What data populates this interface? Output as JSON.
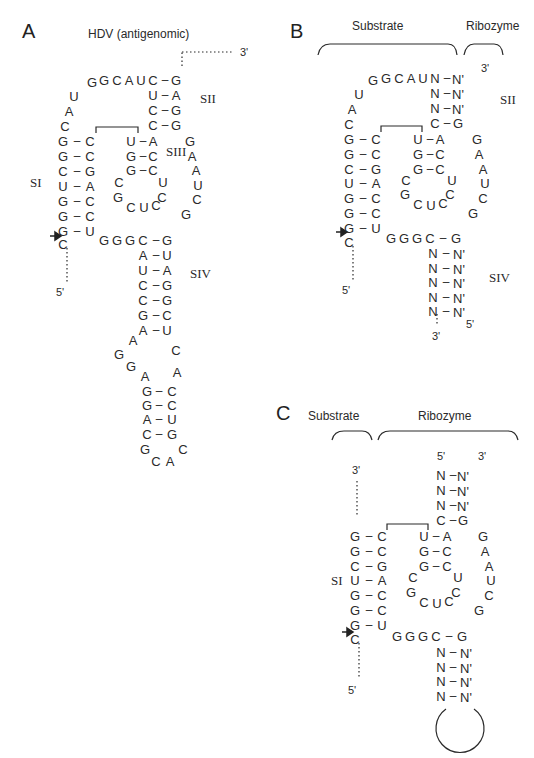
{
  "panels": {
    "A": {
      "letter": "A",
      "title": "HDV (antigenomic)",
      "stems": {
        "SI": "SI",
        "SII": "SII",
        "SIII": "SIII",
        "SIV": "SIV"
      },
      "ends": {
        "three_prime": "3'",
        "five_prime": "5'"
      }
    },
    "B": {
      "letter": "B",
      "brackets": {
        "substrate": "Substrate",
        "ribozyme": "Ribozyme"
      },
      "stems": {
        "SII": "SII",
        "SIV": "SIV"
      },
      "ends": {
        "three_prime_top": "3'",
        "five_prime_left": "5'",
        "five_prime_bottom": "5'",
        "three_prime_bottom": "3'"
      }
    },
    "C": {
      "letter": "C",
      "brackets": {
        "substrate": "Substrate",
        "ribozyme": "Ribozyme"
      },
      "stems": {
        "SI": "SI"
      },
      "ends": {
        "three_prime_substrate": "3'",
        "five_prime_substrate": "5'",
        "five_prime_top": "5'",
        "three_prime_top": "3'"
      }
    }
  },
  "nucleotides": {
    "A": [
      [
        "G",
        92,
        82
      ],
      [
        "G",
        104,
        80
      ],
      [
        "C",
        117,
        80
      ],
      [
        "A",
        129,
        80
      ],
      [
        "U",
        141,
        80
      ],
      [
        "C",
        153,
        80
      ],
      [
        "-",
        165,
        79
      ],
      [
        "G",
        176,
        80
      ],
      [
        "U",
        74,
        96
      ],
      [
        "A",
        69,
        111
      ],
      [
        "C",
        65,
        126
      ],
      [
        "G",
        63,
        141
      ],
      [
        "-",
        77,
        140
      ],
      [
        "C",
        90,
        141
      ],
      [
        "G",
        63,
        156
      ],
      [
        "-",
        77,
        155
      ],
      [
        "C",
        90,
        156
      ],
      [
        "C",
        63,
        171
      ],
      [
        "-",
        77,
        170
      ],
      [
        "G",
        90,
        171
      ],
      [
        "U",
        63,
        186
      ],
      [
        "-",
        77,
        185
      ],
      [
        "A",
        90,
        186
      ],
      [
        "G",
        63,
        201
      ],
      [
        "-",
        77,
        200
      ],
      [
        "C",
        90,
        201
      ],
      [
        "G",
        63,
        216
      ],
      [
        "-",
        77,
        215
      ],
      [
        "C",
        90,
        216
      ],
      [
        "G",
        63,
        231
      ],
      [
        "-",
        77,
        230
      ],
      [
        "U",
        90,
        231
      ],
      [
        "C",
        63,
        244
      ],
      [
        "U",
        153,
        95
      ],
      [
        "-",
        165,
        94
      ],
      [
        "A",
        176,
        95
      ],
      [
        "C",
        153,
        110
      ],
      [
        "-",
        165,
        109
      ],
      [
        "G",
        176,
        110
      ],
      [
        "C",
        153,
        125
      ],
      [
        "-",
        165,
        124
      ],
      [
        "G",
        176,
        125
      ],
      [
        "U",
        131,
        141
      ],
      [
        "-",
        143,
        140
      ],
      [
        "A",
        153,
        141
      ],
      [
        "G",
        131,
        156
      ],
      [
        "-",
        143,
        155
      ],
      [
        "C",
        153,
        156
      ],
      [
        "G",
        131,
        170
      ],
      [
        "-",
        143,
        169
      ],
      [
        "C",
        153,
        170
      ],
      [
        "C",
        119,
        182
      ],
      [
        "U",
        163,
        182
      ],
      [
        "G",
        118,
        197
      ],
      [
        "C",
        162,
        197
      ],
      [
        "C",
        131,
        207
      ],
      [
        "U",
        144,
        207
      ],
      [
        "C",
        156,
        205
      ],
      [
        "G",
        190,
        141
      ],
      [
        "A",
        192,
        156
      ],
      [
        "A",
        196,
        170
      ],
      [
        "U",
        198,
        185
      ],
      [
        "C",
        197,
        199
      ],
      [
        "G",
        186,
        214
      ],
      [
        "G",
        104,
        240
      ],
      [
        "G",
        117,
        240
      ],
      [
        "G",
        130,
        240
      ],
      [
        "C",
        143,
        240
      ],
      [
        "-",
        156,
        239
      ],
      [
        "G",
        167,
        240
      ],
      [
        "A",
        143,
        255
      ],
      [
        "-",
        156,
        254
      ],
      [
        "U",
        167,
        255
      ],
      [
        "U",
        143,
        270
      ],
      [
        "-",
        156,
        269
      ],
      [
        "A",
        167,
        270
      ],
      [
        "C",
        143,
        285
      ],
      [
        "-",
        156,
        284
      ],
      [
        "G",
        167,
        285
      ],
      [
        "C",
        143,
        300
      ],
      [
        "-",
        156,
        299
      ],
      [
        "G",
        167,
        300
      ],
      [
        "G",
        143,
        315
      ],
      [
        "-",
        156,
        314
      ],
      [
        "C",
        167,
        315
      ],
      [
        "A",
        143,
        330
      ],
      [
        "-",
        156,
        329
      ],
      [
        "U",
        167,
        330
      ],
      [
        "A",
        133,
        340
      ],
      [
        "G",
        119,
        354
      ],
      [
        "G",
        131,
        366
      ],
      [
        "A",
        145,
        376
      ],
      [
        "C",
        176,
        350
      ],
      [
        "A",
        177,
        372
      ],
      [
        "G",
        147,
        391
      ],
      [
        "-",
        159,
        390
      ],
      [
        "C",
        172,
        391
      ],
      [
        "G",
        147,
        405
      ],
      [
        "-",
        159,
        404
      ],
      [
        "C",
        172,
        405
      ],
      [
        "A",
        147,
        419
      ],
      [
        "-",
        159,
        418
      ],
      [
        "U",
        172,
        419
      ],
      [
        "C",
        147,
        434
      ],
      [
        "-",
        159,
        433
      ],
      [
        "G",
        172,
        434
      ],
      [
        "G",
        145,
        449
      ],
      [
        "C",
        183,
        449
      ],
      [
        "C",
        156,
        461
      ],
      [
        "A",
        170,
        461
      ]
    ],
    "B": [
      [
        "G",
        373,
        80
      ],
      [
        "G",
        386,
        78
      ],
      [
        "C",
        399,
        78
      ],
      [
        "A",
        411,
        78
      ],
      [
        "U",
        423,
        78
      ],
      [
        "N",
        435,
        78
      ],
      [
        "-",
        447,
        77
      ],
      [
        "N'",
        458,
        79
      ],
      [
        "U",
        359,
        94
      ],
      [
        "A",
        352,
        109
      ],
      [
        "C",
        349,
        124
      ],
      [
        "N",
        435,
        93
      ],
      [
        "-",
        447,
        92
      ],
      [
        "N'",
        458,
        94
      ],
      [
        "N",
        435,
        108
      ],
      [
        "-",
        447,
        107
      ],
      [
        "N'",
        458,
        109
      ],
      [
        "C",
        435,
        123
      ],
      [
        "-",
        447,
        122
      ],
      [
        "G",
        458,
        123
      ],
      [
        "G",
        349,
        139
      ],
      [
        "-",
        363,
        138
      ],
      [
        "C",
        376,
        139
      ],
      [
        "G",
        349,
        154
      ],
      [
        "-",
        363,
        153
      ],
      [
        "C",
        376,
        154
      ],
      [
        "C",
        349,
        169
      ],
      [
        "-",
        363,
        168
      ],
      [
        "G",
        376,
        169
      ],
      [
        "U",
        349,
        183
      ],
      [
        "-",
        363,
        182
      ],
      [
        "A",
        376,
        183
      ],
      [
        "G",
        349,
        198
      ],
      [
        "-",
        363,
        197
      ],
      [
        "C",
        376,
        198
      ],
      [
        "G",
        349,
        213
      ],
      [
        "-",
        363,
        212
      ],
      [
        "C",
        376,
        213
      ],
      [
        "G",
        349,
        228
      ],
      [
        "-",
        363,
        227
      ],
      [
        "U",
        376,
        228
      ],
      [
        "C",
        349,
        242
      ],
      [
        "U",
        418,
        139
      ],
      [
        "-",
        430,
        138
      ],
      [
        "A",
        440,
        139
      ],
      [
        "G",
        418,
        154
      ],
      [
        "-",
        430,
        153
      ],
      [
        "C",
        440,
        154
      ],
      [
        "G",
        418,
        169
      ],
      [
        "-",
        430,
        168
      ],
      [
        "C",
        440,
        169
      ],
      [
        "C",
        406,
        180
      ],
      [
        "U",
        452,
        180
      ],
      [
        "G",
        405,
        194
      ],
      [
        "C",
        450,
        194
      ],
      [
        "C",
        418,
        204
      ],
      [
        "U",
        431,
        205
      ],
      [
        "C",
        443,
        203
      ],
      [
        "G",
        477,
        139
      ],
      [
        "A",
        479,
        154
      ],
      [
        "A",
        483,
        169
      ],
      [
        "U",
        485,
        183
      ],
      [
        "C",
        483,
        198
      ],
      [
        "G",
        473,
        213
      ],
      [
        "G",
        391,
        238
      ],
      [
        "G",
        404,
        238
      ],
      [
        "G",
        417,
        238
      ],
      [
        "C",
        430,
        238
      ],
      [
        "-",
        443,
        237
      ],
      [
        "G",
        456,
        238
      ],
      [
        "N",
        433,
        253
      ],
      [
        "-",
        446,
        252
      ],
      [
        "N'",
        459,
        254
      ],
      [
        "N",
        433,
        268
      ],
      [
        "-",
        446,
        267
      ],
      [
        "N'",
        459,
        269
      ],
      [
        "N",
        433,
        282
      ],
      [
        "-",
        446,
        281
      ],
      [
        "N'",
        459,
        283
      ],
      [
        "N",
        433,
        297
      ],
      [
        "-",
        446,
        296
      ],
      [
        "N'",
        459,
        298
      ],
      [
        "N",
        433,
        311
      ],
      [
        "-",
        446,
        310
      ],
      [
        "N'",
        459,
        312
      ]
    ],
    "C": [
      [
        "N",
        441,
        475
      ],
      [
        "-",
        453,
        474
      ],
      [
        "N'",
        463,
        476
      ],
      [
        "N",
        441,
        490
      ],
      [
        "-",
        453,
        489
      ],
      [
        "N'",
        463,
        491
      ],
      [
        "N",
        441,
        505
      ],
      [
        "-",
        453,
        504
      ],
      [
        "N'",
        463,
        506
      ],
      [
        "C",
        441,
        520
      ],
      [
        "-",
        453,
        519
      ],
      [
        "G",
        463,
        520
      ],
      [
        "G",
        355,
        536
      ],
      [
        "-",
        369,
        535
      ],
      [
        "C",
        382,
        536
      ],
      [
        "G",
        355,
        551
      ],
      [
        "-",
        369,
        550
      ],
      [
        "C",
        382,
        551
      ],
      [
        "C",
        355,
        566
      ],
      [
        "-",
        369,
        565
      ],
      [
        "G",
        382,
        566
      ],
      [
        "U",
        355,
        580
      ],
      [
        "-",
        369,
        579
      ],
      [
        "A",
        382,
        580
      ],
      [
        "G",
        355,
        595
      ],
      [
        "-",
        369,
        594
      ],
      [
        "C",
        382,
        595
      ],
      [
        "G",
        355,
        610
      ],
      [
        "-",
        369,
        609
      ],
      [
        "C",
        382,
        610
      ],
      [
        "G",
        355,
        625
      ],
      [
        "-",
        369,
        624
      ],
      [
        "U",
        382,
        625
      ],
      [
        "C",
        355,
        639
      ],
      [
        "U",
        424,
        536
      ],
      [
        "-",
        436,
        535
      ],
      [
        "A",
        447,
        536
      ],
      [
        "G",
        424,
        551
      ],
      [
        "-",
        436,
        550
      ],
      [
        "C",
        447,
        551
      ],
      [
        "G",
        424,
        566
      ],
      [
        "-",
        436,
        565
      ],
      [
        "C",
        447,
        566
      ],
      [
        "C",
        413,
        577
      ],
      [
        "U",
        458,
        577
      ],
      [
        "G",
        411,
        592
      ],
      [
        "C",
        456,
        592
      ],
      [
        "C",
        424,
        602
      ],
      [
        "U",
        437,
        603
      ],
      [
        "C",
        449,
        601
      ],
      [
        "G",
        483,
        536
      ],
      [
        "A",
        485,
        551
      ],
      [
        "A",
        489,
        566
      ],
      [
        "U",
        491,
        580
      ],
      [
        "C",
        489,
        595
      ],
      [
        "G",
        479,
        610
      ],
      [
        "G",
        397,
        636
      ],
      [
        "G",
        410,
        636
      ],
      [
        "G",
        423,
        636
      ],
      [
        "C",
        436,
        636
      ],
      [
        "-",
        449,
        635
      ],
      [
        "G",
        462,
        636
      ],
      [
        "N",
        441,
        652
      ],
      [
        "-",
        453,
        651
      ],
      [
        "N'",
        466,
        653
      ],
      [
        "N",
        441,
        667
      ],
      [
        "-",
        453,
        666
      ],
      [
        "N'",
        466,
        668
      ],
      [
        "N",
        441,
        681
      ],
      [
        "-",
        453,
        680
      ],
      [
        "N'",
        466,
        682
      ],
      [
        "N",
        441,
        696
      ],
      [
        "-",
        453,
        695
      ],
      [
        "N'",
        466,
        697
      ]
    ]
  }
}
